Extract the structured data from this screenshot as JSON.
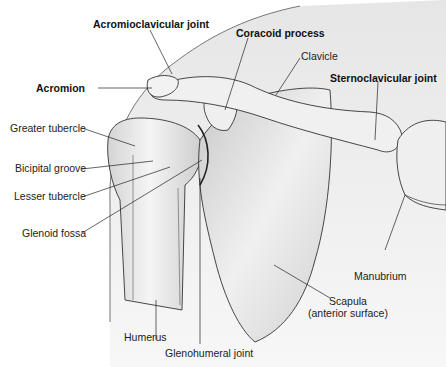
{
  "figure": {
    "labels": {
      "acromioclavicular_joint": "Acromioclavicular joint",
      "coracoid_process": "Coracoid process",
      "clavicle": "Clavicle",
      "sternoclavicular_joint": "Sternoclavicular joint",
      "acromion": "Acromion",
      "greater_tubercle": "Greater tubercle",
      "bicipital_groove": "Bicipital groove",
      "lesser_tubercle": "Lesser tubercle",
      "glenoid_fossa": "Glenoid fossa",
      "manubrium": "Manubrium",
      "scapula_line1": "Scapula",
      "scapula_line2": "(anterior surface)",
      "humerus": "Humerus",
      "glenohumeral_joint": "Glenohumeral joint"
    },
    "colors": {
      "outline": "#333333",
      "bone_fill": "#e6e6e6",
      "shadow_fill": "#cfcfcf",
      "body_silhouette": "#ededed",
      "label_text": "#222222"
    }
  }
}
